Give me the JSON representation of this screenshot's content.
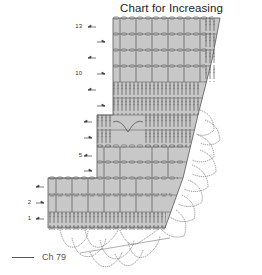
{
  "title": "Chart for Increasing",
  "row_labels": [
    {
      "row": 13,
      "label": "13",
      "y": 27
    },
    {
      "row": 12,
      "label": "",
      "y": 42
    },
    {
      "row": 11,
      "label": "",
      "y": 58
    },
    {
      "row": 10,
      "label": "10",
      "y": 74
    },
    {
      "row": 9,
      "label": "",
      "y": 90
    },
    {
      "row": 8,
      "label": "",
      "y": 106
    },
    {
      "row": 7,
      "label": "",
      "y": 122
    },
    {
      "row": 6,
      "label": "",
      "y": 138
    },
    {
      "row": 5,
      "label": "5",
      "y": 156
    },
    {
      "row": 4,
      "label": "",
      "y": 171
    },
    {
      "row": 3,
      "label": "",
      "y": 187
    },
    {
      "row": 2,
      "label": "2",
      "y": 203
    },
    {
      "row": 1,
      "label": "1",
      "y": 219
    }
  ],
  "foundation": {
    "label": "Ch 79"
  },
  "colors": {
    "fill": "#c8c8c8",
    "stitch": "#555555",
    "text": "#222222"
  }
}
